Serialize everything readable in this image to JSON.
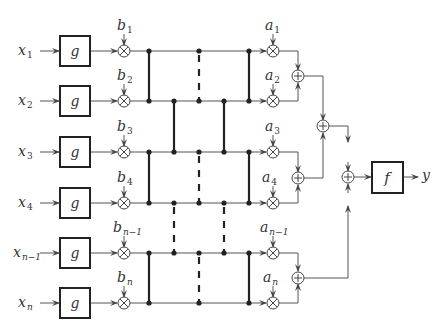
{
  "diagram": {
    "type": "block-diagram",
    "inputs": [
      {
        "base": "x",
        "sub": "1"
      },
      {
        "base": "x",
        "sub": "2"
      },
      {
        "base": "x",
        "sub": "3"
      },
      {
        "base": "x",
        "sub": "4"
      },
      {
        "base": "x",
        "sub": "n−1"
      },
      {
        "base": "x",
        "sub": "n"
      }
    ],
    "g_blocks": [
      {
        "label": "g"
      },
      {
        "label": "g"
      },
      {
        "label": "g"
      },
      {
        "label": "g"
      },
      {
        "label": "g"
      },
      {
        "label": "g"
      }
    ],
    "b_weights": [
      {
        "base": "b",
        "sub": "1"
      },
      {
        "base": "b",
        "sub": "2"
      },
      {
        "base": "b",
        "sub": "3"
      },
      {
        "base": "b",
        "sub": "4"
      },
      {
        "base": "b",
        "sub": "n−1"
      },
      {
        "base": "b",
        "sub": "n"
      }
    ],
    "a_weights": [
      {
        "base": "a",
        "sub": "1"
      },
      {
        "base": "a",
        "sub": "2"
      },
      {
        "base": "a",
        "sub": "3"
      },
      {
        "base": "a",
        "sub": "4"
      },
      {
        "base": "a",
        "sub": "n−1"
      },
      {
        "base": "a",
        "sub": "n"
      }
    ],
    "output_block": {
      "label": "f"
    },
    "output": {
      "label": "y"
    },
    "multiplier_symbol": "⊗",
    "adder_symbol": "⊕",
    "line_color": "#555555",
    "thick_line_color": "#222222"
  }
}
